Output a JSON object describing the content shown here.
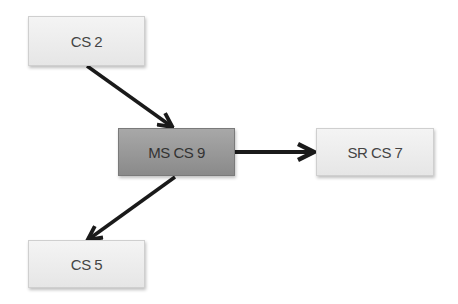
{
  "diagram": {
    "nodes": [
      {
        "id": "cs2",
        "label": "CS 2"
      },
      {
        "id": "mscs9",
        "label": "MS CS 9"
      },
      {
        "id": "srcs7",
        "label": "SR CS 7"
      },
      {
        "id": "cs5",
        "label": "CS 5"
      }
    ],
    "edges": [
      {
        "from": "cs2",
        "to": "mscs9"
      },
      {
        "from": "mscs9",
        "to": "srcs7"
      },
      {
        "from": "mscs9",
        "to": "cs5"
      }
    ],
    "colors": {
      "node_fill": "#ececec",
      "main_node_fill": "#999999",
      "arrow": "#1a1a1a"
    }
  }
}
